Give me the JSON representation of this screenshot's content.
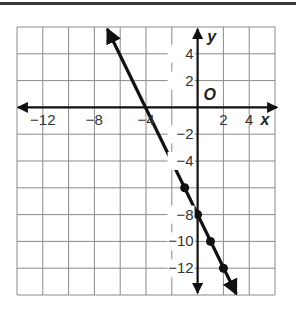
{
  "chart_data": {
    "type": "line",
    "title": "",
    "xlabel": "x",
    "ylabel": "y",
    "origin_label": "O",
    "xlim": [
      -14,
      6
    ],
    "ylim": [
      -14,
      6
    ],
    "grid": true,
    "grid_step": 2,
    "x_tick_labels": [
      {
        "value": -12,
        "label": "−12"
      },
      {
        "value": -8,
        "label": "−8"
      },
      {
        "value": -4,
        "label": "−4"
      },
      {
        "value": 2,
        "label": "2"
      },
      {
        "value": 4,
        "label": "4"
      }
    ],
    "y_tick_labels": [
      {
        "value": 4,
        "label": "4"
      },
      {
        "value": 2,
        "label": "2"
      },
      {
        "value": -2,
        "label": "−2"
      },
      {
        "value": -4,
        "label": "−4"
      },
      {
        "value": -8,
        "label": "−8"
      },
      {
        "value": -10,
        "label": "−10"
      },
      {
        "value": -12,
        "label": "−12"
      }
    ],
    "series": [
      {
        "name": "line",
        "equation": "y = -2x - 8",
        "slope": -2,
        "intercept": -8,
        "arrows_both_ends": true,
        "points": [
          {
            "x": -1,
            "y": -6
          },
          {
            "x": 0,
            "y": -8
          },
          {
            "x": 1,
            "y": -10
          },
          {
            "x": 2,
            "y": -12
          }
        ]
      }
    ]
  }
}
